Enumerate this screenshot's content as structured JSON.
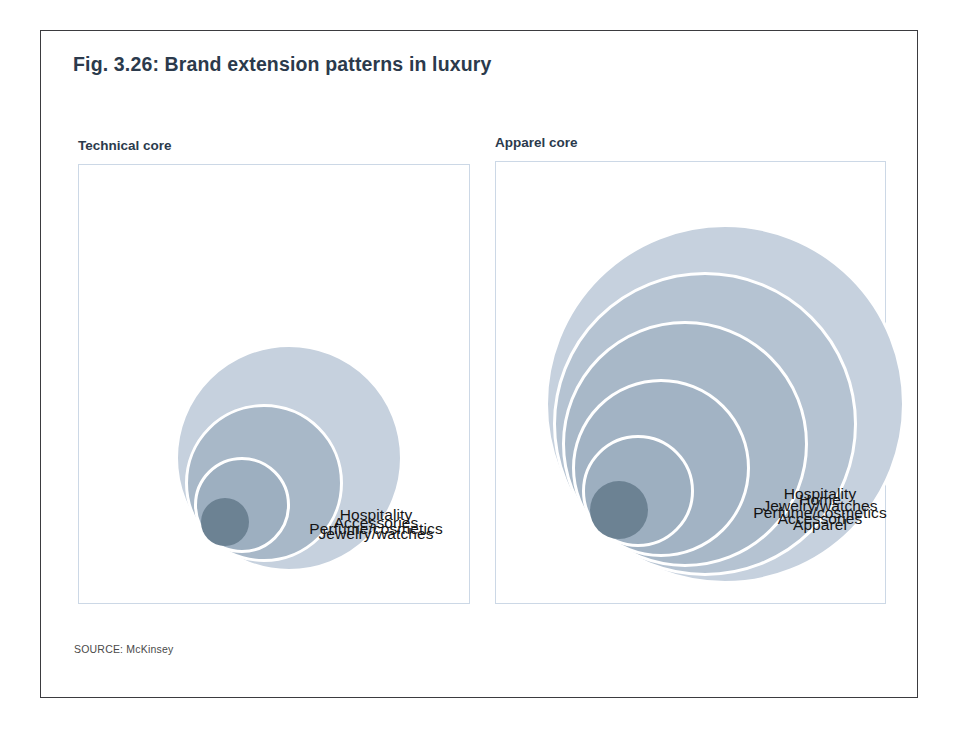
{
  "figure": {
    "title": "Fig. 3.26: Brand extension patterns in luxury",
    "source": "SOURCE: McKinsey"
  },
  "colors": {
    "title_color": "#2b3a4c",
    "frame_border": "#3b3b3f",
    "panel_border": "#ccd8e6",
    "ring_stroke": "#ffffff",
    "label_color": "#141414",
    "bubble_lightest": "#c6d1de",
    "bubble_light": "#b5c3d2",
    "bubble_mid": "#a8b8c8",
    "bubble_mid_dark": "#9dafc0",
    "bubble_dark": "#8a9fb2",
    "bubble_darkest": "#6c8293"
  },
  "chart_data": {
    "type": "bubble",
    "title": "Fig. 3.26: Brand extension patterns in luxury",
    "panels": [
      {
        "name": "technical-core",
        "label": "Technical core",
        "circle_count": 4,
        "rings": [
          {
            "order": 1,
            "label": "Jewelry/watches",
            "radius": 24,
            "color": "#6c8293",
            "is_core": true
          },
          {
            "order": 2,
            "label": "Perfume/cosmetics",
            "radius": 48,
            "color": "#9dafc0",
            "is_core": false
          },
          {
            "order": 3,
            "label": "Accessories",
            "radius": 79,
            "color": "#a8b8c8",
            "is_core": false
          },
          {
            "order": 4,
            "label": "Hospitality",
            "radius": 114,
            "color": "#c6d1de",
            "is_core": false
          }
        ]
      },
      {
        "name": "apparel-core",
        "label": "Apparel core",
        "circle_count": 6,
        "rings": [
          {
            "order": 1,
            "label": "Apparel",
            "radius": 29,
            "color": "#6c8293",
            "is_core": true
          },
          {
            "order": 2,
            "label": "Accessories",
            "radius": 56,
            "color": "#9dafc0",
            "is_core": false
          },
          {
            "order": 3,
            "label": "Perfume/cosmetics",
            "radius": 89,
            "color": "#a2b3c4",
            "is_core": false
          },
          {
            "order": 4,
            "label": "Jewelry/watches",
            "radius": 123,
            "color": "#a8b8c8",
            "is_core": false
          },
          {
            "order": 5,
            "label": "Home",
            "radius": 152,
            "color": "#b5c3d2",
            "is_core": false
          },
          {
            "order": 6,
            "label": "Hospitality",
            "radius": 180,
            "color": "#c6d1de",
            "is_core": false
          }
        ]
      }
    ]
  }
}
